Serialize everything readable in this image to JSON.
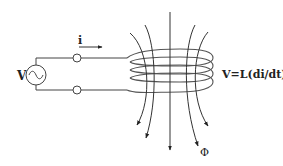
{
  "diagram": {
    "source_label": "V",
    "current_label": "i",
    "equation": "V=L(di/dt)",
    "flux_label": "Φ",
    "components": [
      {
        "id": "ac-source",
        "type": "sinusoidal voltage source"
      },
      {
        "id": "terminal-top",
        "type": "terminal"
      },
      {
        "id": "terminal-bottom",
        "type": "terminal"
      },
      {
        "id": "coil",
        "type": "inductor coil",
        "turns": 4
      },
      {
        "id": "field-lines",
        "type": "magnetic field lines",
        "count": 5
      }
    ],
    "colors": {
      "line": "#333333",
      "background": "#ffffff"
    }
  }
}
